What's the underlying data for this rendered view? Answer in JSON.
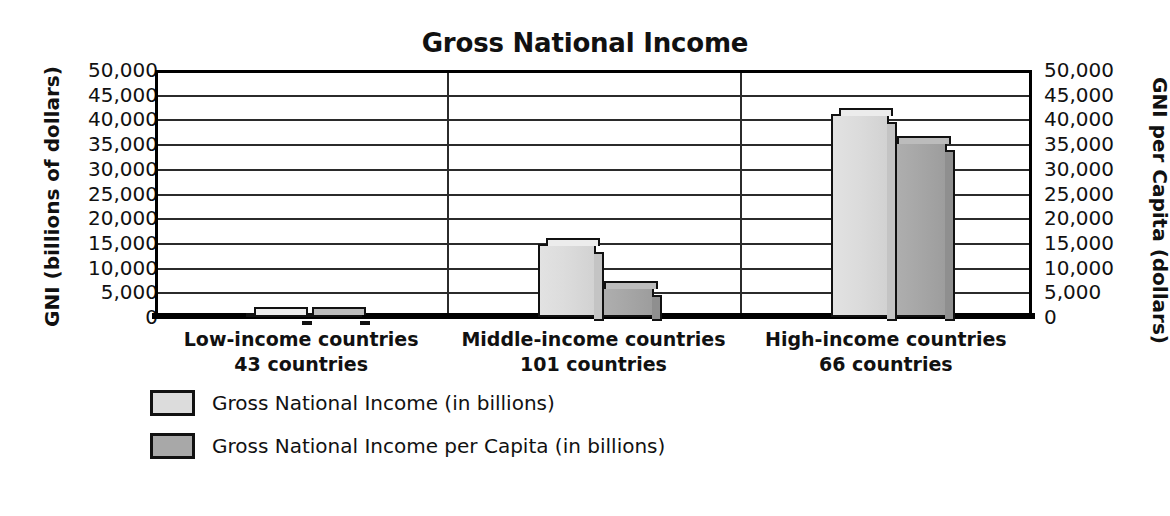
{
  "chart_data": {
    "type": "bar",
    "title": "Gross National Income",
    "xlabel": "",
    "ylabel": "GNI (billions of dollars)",
    "y2label": "GNI per Capita (dollars)",
    "ylim": [
      0,
      50000
    ],
    "y2lim": [
      0,
      50000
    ],
    "grid": true,
    "legend_position": "bottom-left",
    "tick_labels": [
      "50,000",
      "45,000",
      "40,000",
      "35,000",
      "30,000",
      "25,000",
      "20,000",
      "15,000",
      "10,000",
      "5,000",
      "0"
    ],
    "tick_values": [
      50000,
      45000,
      40000,
      35000,
      30000,
      25000,
      20000,
      15000,
      10000,
      5000,
      0
    ],
    "categories": [
      "Low-income countries",
      "Middle-income countries",
      "High-income countries"
    ],
    "category_sublabels": [
      "43 countries",
      "101 countries",
      "66 countries"
    ],
    "series": [
      {
        "name": "Gross National Income (in billions)",
        "axis": "left",
        "color": "#dcdcdc",
        "values": [
          700,
          14700,
          41000
        ]
      },
      {
        "name": "Gross National Income per Capita (in billions)",
        "axis": "right",
        "color": "#a8a8a8",
        "values": [
          900,
          6000,
          35500
        ]
      }
    ]
  },
  "chart": {
    "title": "Gross National Income",
    "left_axis_title": "GNI (billions of dollars)",
    "right_axis_title": "GNI per Capita (dollars)"
  },
  "legend": {
    "items": [
      {
        "label": "Gross National Income (in billions)",
        "swatch": "light"
      },
      {
        "label": "Gross National Income per Capita (in billions)",
        "swatch": "dark"
      }
    ]
  },
  "colors": {
    "series_light": "#dcdcdc",
    "series_dark": "#a8a8a8",
    "axis": "#000000",
    "grid": "#2b2b2b",
    "background": "#ffffff"
  }
}
